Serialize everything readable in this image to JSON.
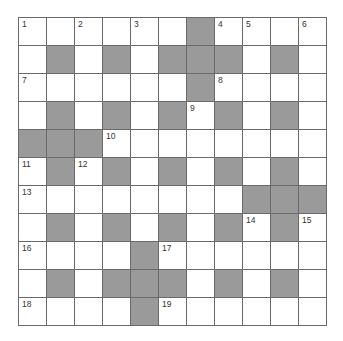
{
  "puzzle": {
    "size": 11,
    "shade_color": "#9a9a9a",
    "rows": [
      "WWWWWWBWWWW",
      "WBWBWBBBWBW",
      "WWWWWWBWWWW",
      "WBWBWBWBWBW",
      "BBBWWWWWWWW",
      "WBWBWBWBWBW",
      "WWWWWWWWBBB",
      "WBWBWBWBWBW",
      "WWWWBWWWWWW",
      "WBWBBBWBWBW",
      "WWWWBWWWWWW"
    ],
    "numbers": [
      {
        "r": 0,
        "c": 0,
        "n": "1"
      },
      {
        "r": 0,
        "c": 2,
        "n": "2"
      },
      {
        "r": 0,
        "c": 4,
        "n": "3"
      },
      {
        "r": 0,
        "c": 7,
        "n": "4"
      },
      {
        "r": 0,
        "c": 8,
        "n": "5"
      },
      {
        "r": 0,
        "c": 10,
        "n": "6"
      },
      {
        "r": 2,
        "c": 0,
        "n": "7"
      },
      {
        "r": 2,
        "c": 7,
        "n": "8"
      },
      {
        "r": 3,
        "c": 6,
        "n": "9"
      },
      {
        "r": 4,
        "c": 3,
        "n": "10"
      },
      {
        "r": 5,
        "c": 0,
        "n": "11"
      },
      {
        "r": 5,
        "c": 2,
        "n": "12"
      },
      {
        "r": 6,
        "c": 0,
        "n": "13"
      },
      {
        "r": 7,
        "c": 8,
        "n": "14"
      },
      {
        "r": 7,
        "c": 10,
        "n": "15"
      },
      {
        "r": 8,
        "c": 0,
        "n": "16"
      },
      {
        "r": 8,
        "c": 5,
        "n": "17"
      },
      {
        "r": 10,
        "c": 0,
        "n": "18"
      },
      {
        "r": 10,
        "c": 5,
        "n": "19"
      }
    ]
  }
}
